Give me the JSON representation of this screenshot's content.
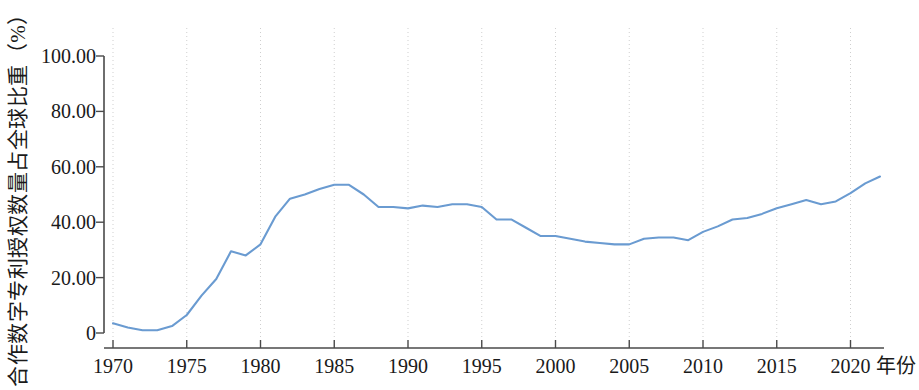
{
  "chart_data": {
    "type": "line",
    "title": "",
    "xlabel": "年份",
    "ylabel": "合作数字专利授权数量占全球比重（%）",
    "xlim": [
      1970,
      2022
    ],
    "ylim": [
      0,
      100
    ],
    "grid": "vertical dotted gridlines at every 5 years",
    "legend": "none",
    "line_color": "#6A9BD1",
    "x_tick_labels": [
      "1970",
      "1975",
      "1980",
      "1985",
      "1990",
      "1995",
      "2000",
      "2005",
      "2010",
      "2015",
      "2020"
    ],
    "x_ticks": [
      1970,
      1975,
      1980,
      1985,
      1990,
      1995,
      2000,
      2005,
      2010,
      2015,
      2020
    ],
    "y_tick_labels": [
      "100.00",
      "80.00",
      "60.00",
      "40.00",
      "20.00",
      "0"
    ],
    "y_ticks": [
      100,
      80,
      60,
      40,
      20,
      0
    ],
    "series": [
      {
        "name": "合作数字专利授权数量占全球比重",
        "x": [
          1970,
          1971,
          1972,
          1973,
          1974,
          1975,
          1976,
          1977,
          1978,
          1979,
          1980,
          1981,
          1982,
          1983,
          1984,
          1985,
          1986,
          1987,
          1988,
          1989,
          1990,
          1991,
          1992,
          1993,
          1994,
          1995,
          1996,
          1997,
          1998,
          1999,
          2000,
          2001,
          2002,
          2003,
          2004,
          2005,
          2006,
          2007,
          2008,
          2009,
          2010,
          2011,
          2012,
          2013,
          2014,
          2015,
          2016,
          2017,
          2018,
          2019,
          2020,
          2021,
          2022
        ],
        "values": [
          3.5,
          2.0,
          1.0,
          1.0,
          2.5,
          6.5,
          13.5,
          19.5,
          29.5,
          28.0,
          32.0,
          42.0,
          48.5,
          50.0,
          52.0,
          53.5,
          53.5,
          50.0,
          45.5,
          45.5,
          45.0,
          46.0,
          45.5,
          46.5,
          46.5,
          45.5,
          41.0,
          41.0,
          38.0,
          35.0,
          35.0,
          34.0,
          33.0,
          32.5,
          32.0,
          32.0,
          34.0,
          34.5,
          34.5,
          33.5,
          36.5,
          38.5,
          41.0,
          41.5,
          43.0,
          45.0,
          46.5,
          48.0,
          46.5,
          47.5,
          50.5,
          54.0,
          56.5
        ]
      }
    ]
  },
  "axes": {
    "y_title": "合作数字专利授权数量占全球比重（%）",
    "x_title": "年份",
    "y_labels": [
      "100.00",
      "80.00",
      "60.00",
      "40.00",
      "20.00",
      "0"
    ],
    "x_labels": [
      "1970",
      "1975",
      "1980",
      "1985",
      "1990",
      "1995",
      "2000",
      "2005",
      "2010",
      "2015",
      "2020"
    ]
  }
}
